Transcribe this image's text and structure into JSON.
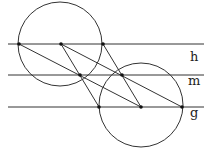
{
  "diagram": {
    "labels": {
      "h": "h",
      "m": "m",
      "g": "g"
    },
    "lines": [
      {
        "name": "h",
        "y": 44
      },
      {
        "name": "m",
        "y": 75
      },
      {
        "name": "g",
        "y": 107
      }
    ],
    "circles": [
      {
        "cx": 60,
        "cy": 44,
        "r": 42
      },
      {
        "cx": 141,
        "cy": 105,
        "r": 42
      }
    ],
    "points": [
      {
        "x": 19,
        "y": 44
      },
      {
        "x": 61,
        "y": 44
      },
      {
        "x": 103,
        "y": 44
      },
      {
        "x": 80,
        "y": 75
      },
      {
        "x": 122,
        "y": 75
      },
      {
        "x": 99,
        "y": 107
      },
      {
        "x": 141,
        "y": 107
      },
      {
        "x": 182,
        "y": 107
      }
    ],
    "colors": {
      "stroke": "#222222"
    }
  }
}
